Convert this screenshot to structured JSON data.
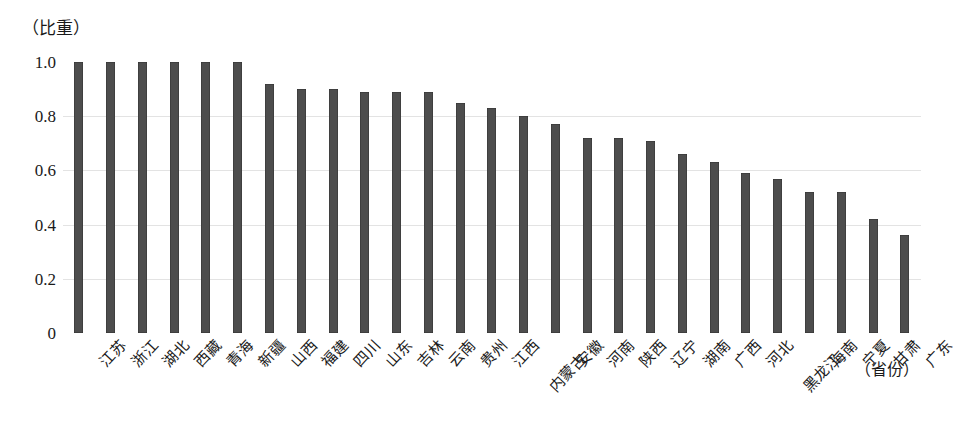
{
  "chart_data": {
    "type": "bar",
    "title": "",
    "subtitle": "",
    "xlabel": "（省份）",
    "ylabel": "（比重）",
    "ylim": [
      0,
      1.0
    ],
    "grid": true,
    "legend": "none",
    "bar_color": "#4d4d4d",
    "ytick_labels": [
      "1.0",
      "0.8",
      "0.6",
      "0.4",
      "0.2",
      "0"
    ],
    "ytick_values": [
      1.0,
      0.8,
      0.6,
      0.4,
      0.2,
      0
    ],
    "categories": [
      "江苏",
      "浙江",
      "湖北",
      "西藏",
      "青海",
      "新疆",
      "山西",
      "福建",
      "四川",
      "山东",
      "吉林",
      "云南",
      "贵州",
      "江西",
      "内蒙古",
      "安徽",
      "河南",
      "陕西",
      "辽宁",
      "湖南",
      "广西",
      "河北",
      "黑龙江",
      "海南",
      "宁夏",
      "甘肃",
      "广东"
    ],
    "values": [
      1.0,
      1.0,
      1.0,
      1.0,
      1.0,
      1.0,
      0.92,
      0.9,
      0.9,
      0.89,
      0.89,
      0.89,
      0.85,
      0.83,
      0.8,
      0.77,
      0.72,
      0.72,
      0.71,
      0.66,
      0.63,
      0.59,
      0.57,
      0.52,
      0.52,
      0.42,
      0.36
    ],
    "staggered_label_indices": [
      14,
      22
    ]
  }
}
